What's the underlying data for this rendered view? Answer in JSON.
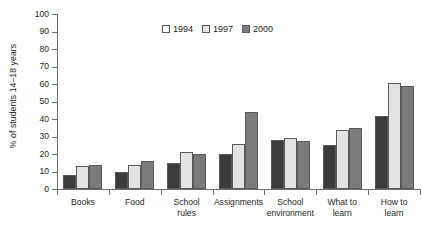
{
  "chart_data": {
    "type": "bar",
    "title": "",
    "xlabel": "",
    "ylabel": "% of students 14–18 years",
    "ylim": [
      0,
      100
    ],
    "ytick_step": 10,
    "yticks": [
      0,
      10,
      20,
      30,
      40,
      50,
      60,
      70,
      80,
      90,
      100
    ],
    "grid": false,
    "legend_position": "top-center",
    "categories": [
      "Books",
      "Food",
      "School rules",
      "Assignments",
      "School environment",
      "What to learn",
      "How to learn"
    ],
    "series": [
      {
        "name": "1994",
        "color": "#3b3b3b",
        "legend_swatch_color": "#ffffff",
        "values": [
          8,
          10,
          15,
          20,
          28,
          25,
          42
        ]
      },
      {
        "name": "1997",
        "color": "#e3e3e3",
        "legend_swatch_color": "#e3e3e3",
        "values": [
          13,
          14,
          21,
          26,
          29,
          34,
          60.5
        ]
      },
      {
        "name": "2000",
        "color": "#7b7b7b",
        "legend_swatch_color": "#7b7b7b",
        "values": [
          14,
          16,
          20,
          44,
          27.5,
          35,
          59
        ]
      }
    ]
  },
  "category_label_lines": [
    [
      "Books"
    ],
    [
      "Food"
    ],
    [
      "School",
      "rules"
    ],
    [
      "Assignments"
    ],
    [
      "School",
      "environment"
    ],
    [
      "What to",
      "learn"
    ],
    [
      "How to",
      "learn"
    ]
  ],
  "colors": {
    "axis": "#6d6e71",
    "text": "#231f20",
    "bar_outline": "#58595b",
    "series_1994": "#3b3b3b",
    "series_1997": "#e3e3e3",
    "series_2000": "#7b7b7b"
  }
}
